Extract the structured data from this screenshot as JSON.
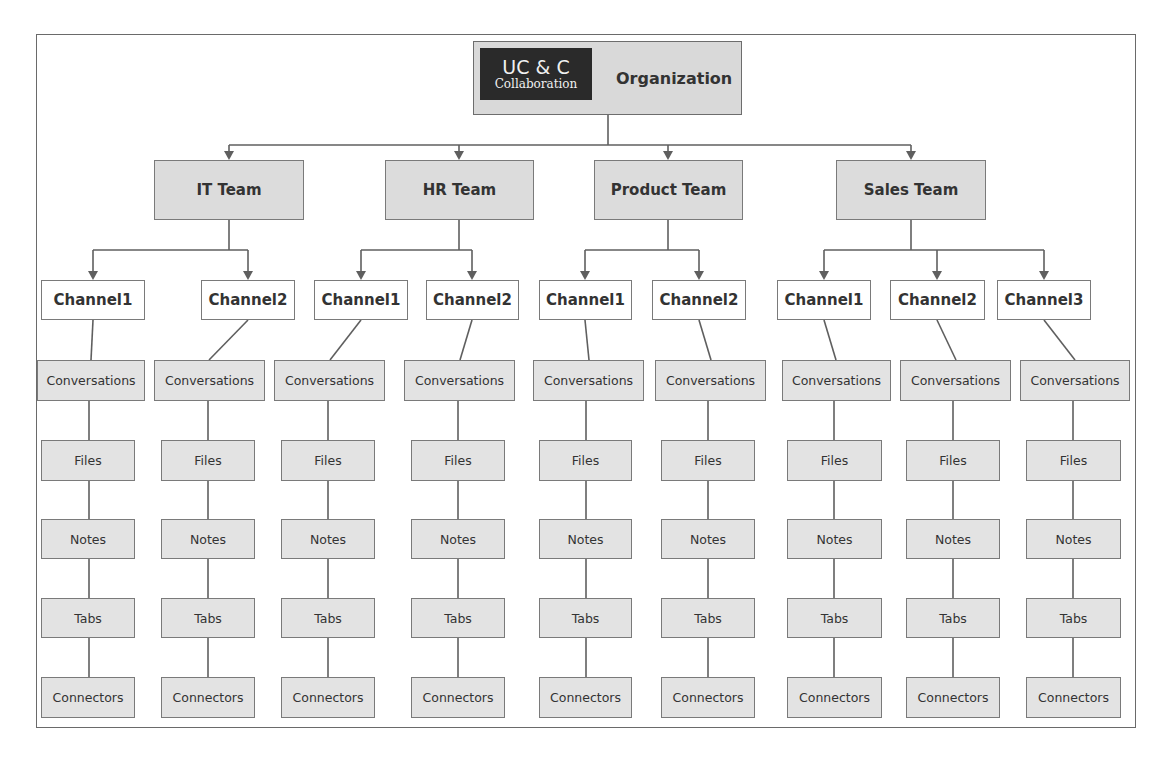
{
  "root": {
    "logo": {
      "line1": "UC & C",
      "line2": "Collaboration"
    },
    "title": "Organization"
  },
  "teams": [
    {
      "name": "IT Team",
      "channels": [
        "Channel1",
        "Channel2"
      ]
    },
    {
      "name": "HR Team",
      "channels": [
        "Channel1",
        "Channel2"
      ]
    },
    {
      "name": "Product Team",
      "channels": [
        "Channel1",
        "Channel2"
      ]
    },
    {
      "name": "Sales Team",
      "channels": [
        "Channel1",
        "Channel2",
        "Channel3"
      ]
    }
  ],
  "channel_items": [
    "Conversations",
    "Files",
    "Notes",
    "Tabs",
    "Connectors"
  ],
  "columns": [
    {
      "team": "IT Team",
      "channel": "Channel1",
      "items": [
        "Conversations",
        "Files",
        "Notes",
        "Tabs",
        "Connectors"
      ]
    },
    {
      "team": "IT Team",
      "channel": "Channel2",
      "items": [
        "Conversations",
        "Files",
        "Notes",
        "Tabs",
        "Connectors"
      ]
    },
    {
      "team": "HR Team",
      "channel": "Channel1",
      "items": [
        "Conversations",
        "Files",
        "Notes",
        "Tabs",
        "Connectors"
      ]
    },
    {
      "team": "HR Team",
      "channel": "Channel2",
      "items": [
        "Conversations",
        "Files",
        "Notes",
        "Tabs",
        "Connectors"
      ]
    },
    {
      "team": "Product Team",
      "channel": "Channel1",
      "items": [
        "Conversations",
        "Files",
        "Notes",
        "Tabs",
        "Connectors"
      ]
    },
    {
      "team": "Product Team",
      "channel": "Channel2",
      "items": [
        "Conversations",
        "Files",
        "Notes",
        "Tabs",
        "Connectors"
      ]
    },
    {
      "team": "Sales Team",
      "channel": "Channel1",
      "items": [
        "Conversations",
        "Files",
        "Notes",
        "Tabs",
        "Connectors"
      ]
    },
    {
      "team": "Sales Team",
      "channel": "Channel2",
      "items": [
        "Conversations",
        "Files",
        "Notes",
        "Tabs",
        "Connectors"
      ]
    },
    {
      "team": "Sales Team",
      "channel": "Channel3",
      "items": [
        "Conversations",
        "Files",
        "Notes",
        "Tabs",
        "Connectors"
      ]
    }
  ],
  "colors": {
    "line": "#5f5f5f",
    "box_fill": "#e3e3e3",
    "team_fill": "#dcdcdc",
    "logo_bg": "#2a2a2a"
  }
}
